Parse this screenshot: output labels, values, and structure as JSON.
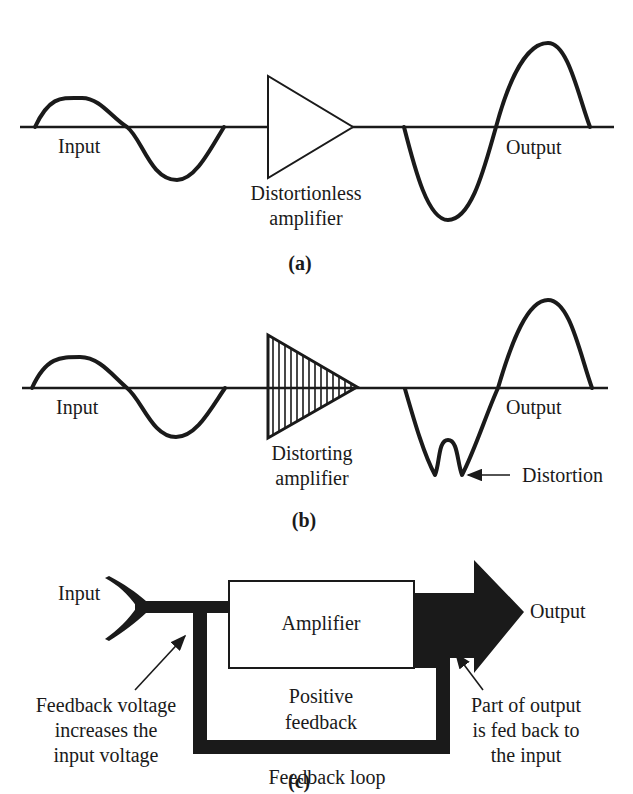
{
  "colors": {
    "ink": "#1a1a1a",
    "background": "#ffffff"
  },
  "panel_a": {
    "input_label": "Input",
    "output_label": "Output",
    "amplifier_label_line1": "Distortionless",
    "amplifier_label_line2": "amplifier",
    "caption": "(a)"
  },
  "panel_b": {
    "input_label": "Input",
    "output_label": "Output",
    "amplifier_label_line1": "Distorting",
    "amplifier_label_line2": "amplifier",
    "distortion_label": "Distortion",
    "caption": "(b)"
  },
  "panel_c": {
    "input_label": "Input",
    "output_label": "Output",
    "amplifier_label": "Amplifier",
    "positive_feedback_line1": "Positive",
    "positive_feedback_line2": "feedback",
    "left_note_line1": "Feedback voltage",
    "left_note_line2": "increases the",
    "left_note_line3": "input voltage",
    "right_note_line1": "Part of output",
    "right_note_line2": "is fed back to",
    "right_note_line3": "the input",
    "loop_label": "Feedback loop",
    "caption": "(c)"
  }
}
